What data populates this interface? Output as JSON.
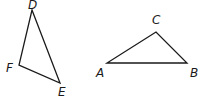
{
  "diagram": {
    "triangles": [
      {
        "name": "DEF",
        "vertices": [
          {
            "label": "D",
            "x": 32,
            "y": 10,
            "label_x": 28,
            "label_y": 9
          },
          {
            "label": "E",
            "x": 60,
            "y": 83,
            "label_x": 58,
            "label_y": 96
          },
          {
            "label": "F",
            "x": 19,
            "y": 65,
            "label_x": 6,
            "label_y": 72
          }
        ]
      },
      {
        "name": "ABC",
        "vertices": [
          {
            "label": "A",
            "x": 107,
            "y": 63,
            "label_x": 96,
            "label_y": 77
          },
          {
            "label": "B",
            "x": 187,
            "y": 63,
            "label_x": 190,
            "label_y": 77
          },
          {
            "label": "C",
            "x": 156,
            "y": 32,
            "label_x": 152,
            "label_y": 24
          }
        ]
      }
    ],
    "colors": {
      "stroke": "#1a1a1a",
      "background": "#ffffff"
    }
  }
}
